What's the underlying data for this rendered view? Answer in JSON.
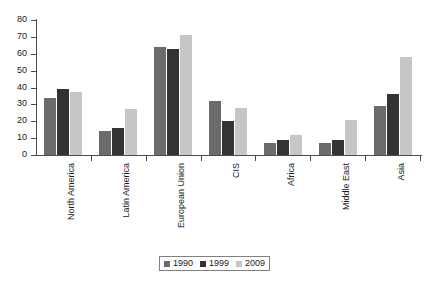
{
  "chart_data": {
    "type": "bar",
    "title": "",
    "subtitle": "",
    "xlabel": "",
    "ylabel": "",
    "ylim": [
      0,
      80
    ],
    "yticks": [
      0,
      10,
      20,
      30,
      40,
      50,
      60,
      70,
      80
    ],
    "grid": false,
    "legend_position": "bottom",
    "categories": [
      "North America",
      "Latin America",
      "European Union",
      "CIS",
      "Africa",
      "Middle East",
      "Asia"
    ],
    "series": [
      {
        "name": "1990",
        "color": "#6b6b6b",
        "values": [
          34,
          14,
          64,
          32,
          7,
          7,
          29
        ]
      },
      {
        "name": "1999",
        "color": "#333333",
        "values": [
          39,
          16,
          63,
          20,
          9,
          9,
          36
        ]
      },
      {
        "name": "2009",
        "color": "#c6c6c6",
        "values": [
          37.5,
          27,
          71,
          28,
          12,
          21,
          58
        ]
      }
    ]
  },
  "axis": {
    "y_tick_labels": [
      "0",
      "10",
      "20",
      "30",
      "40",
      "50",
      "60",
      "70",
      "80"
    ]
  },
  "legend": {
    "entries": [
      "1990",
      "1999",
      "2009"
    ]
  }
}
